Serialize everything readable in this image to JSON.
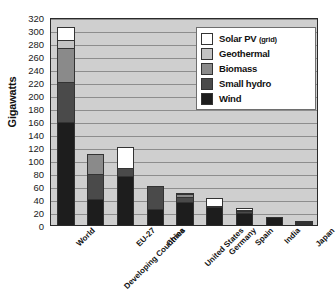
{
  "chart_data": {
    "type": "bar",
    "stacked": true,
    "title": "",
    "xlabel": "",
    "ylabel": "Gigawatts",
    "ylim": [
      0,
      320
    ],
    "ytick_step": 20,
    "grid": true,
    "legend_position": "top-right",
    "categories": [
      "World",
      "Developing Countries",
      "EU-27",
      "China",
      "United States",
      "Germany",
      "Spain",
      "India",
      "Japan"
    ],
    "ytick_labels": [
      "320",
      "300",
      "280",
      "260",
      "240",
      "220",
      "200",
      "180",
      "160",
      "140",
      "120",
      "100",
      "80",
      "60",
      "40",
      "20",
      "0"
    ],
    "series": [
      {
        "name": "Wind",
        "color": "#1d1d1d",
        "values": [
          159,
          40,
          75,
          25,
          36,
          27,
          19,
          13,
          2
        ]
      },
      {
        "name": "Small hydro",
        "color": "#4a4a4a",
        "values": [
          61,
          38,
          12,
          35,
          7,
          2,
          2,
          0,
          1
        ]
      },
      {
        "name": "Biomass",
        "color": "#8a8a8a",
        "values": [
          53,
          32,
          0,
          0,
          4,
          0,
          1,
          0,
          1
        ]
      },
      {
        "name": "Geothermal",
        "color": "#c3c3c3",
        "values": [
          11,
          0,
          0,
          0,
          3,
          0,
          0,
          0,
          0
        ]
      },
      {
        "name": "Solar PV (grid)",
        "color": "#ffffff",
        "values": [
          21,
          0,
          33,
          0,
          0,
          13,
          3,
          0,
          1
        ]
      }
    ],
    "totals": [
      305,
      110,
      120,
      60,
      50,
      42,
      25,
      13,
      5
    ],
    "annotations": []
  },
  "legend": {
    "items": [
      {
        "label": "Solar PV ",
        "sub": "(grid)",
        "color": "#ffffff"
      },
      {
        "label": "Geothermal",
        "sub": "",
        "color": "#c3c3c3"
      },
      {
        "label": "Biomass",
        "sub": "",
        "color": "#8a8a8a"
      },
      {
        "label": "Small hydro",
        "sub": "",
        "color": "#4a4a4a"
      },
      {
        "label": "Wind",
        "sub": "",
        "color": "#1d1d1d"
      }
    ]
  },
  "colors": {
    "plot_background": "#cfcfcf",
    "gridline": "#8d8d8d",
    "axis": "#2a2a2a",
    "text": "#111111",
    "legend_background": "#ffffff"
  }
}
